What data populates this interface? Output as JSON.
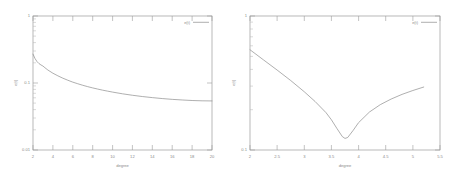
{
  "figure": {
    "background_color": "#ffffff",
    "line_color": "#8d8d8d",
    "axis_color": "#9a9a9a",
    "panel_count": 2
  },
  "chart_data": [
    {
      "type": "line",
      "panel": "left",
      "title": "",
      "xlabel": "degree",
      "ylabel": "e(t)",
      "xscale": "linear",
      "yscale": "log",
      "xlim": [
        2,
        20
      ],
      "ylim": [
        0.01,
        1
      ],
      "grid": false,
      "legend_position": "top-right",
      "xticks": [
        2,
        4,
        6,
        8,
        10,
        12,
        14,
        16,
        18,
        20
      ],
      "xticklabels": [
        "2",
        "4",
        "6",
        "8",
        "10",
        "12",
        "14",
        "16",
        "18",
        "20"
      ],
      "yticks": [
        0.01,
        0.1,
        1
      ],
      "yticklabels": [
        "0.01",
        "0.1",
        "1"
      ],
      "series": [
        {
          "name": "e(t)",
          "x": [
            2,
            2.2,
            2.4,
            2.6,
            2.8,
            3,
            3.2,
            3.5,
            4,
            4.5,
            5,
            5.5,
            6,
            6.5,
            7,
            7.5,
            8,
            8.5,
            9,
            9.5,
            10,
            11,
            12,
            13,
            14,
            15,
            16,
            17,
            18,
            19,
            20
          ],
          "y": [
            0.27,
            0.232,
            0.209,
            0.195,
            0.186,
            0.179,
            0.169,
            0.156,
            0.14,
            0.128,
            0.118,
            0.11,
            0.103,
            0.0975,
            0.0925,
            0.0882,
            0.0845,
            0.0812,
            0.0782,
            0.0756,
            0.0732,
            0.069,
            0.0656,
            0.0628,
            0.0605,
            0.0586,
            0.057,
            0.0558,
            0.0548,
            0.0542,
            0.054
          ]
        }
      ]
    },
    {
      "type": "line",
      "panel": "right",
      "title": "",
      "xlabel": "degree",
      "ylabel": "e(t)",
      "xscale": "linear",
      "yscale": "log",
      "xlim": [
        2,
        5.5
      ],
      "ylim": [
        0.1,
        1
      ],
      "grid": false,
      "legend_position": "top-right",
      "xticks": [
        2,
        2.5,
        3,
        3.5,
        4,
        4.5,
        5,
        5.5
      ],
      "xticklabels": [
        "2",
        "2.5",
        "3",
        "3.5",
        "4",
        "4.5",
        "5",
        "5.5"
      ],
      "yticks": [
        0.1,
        1
      ],
      "yticklabels": [
        "0.1",
        "1"
      ],
      "series": [
        {
          "name": "e(t)",
          "x": [
            2,
            2.25,
            2.5,
            2.75,
            3,
            3.2,
            3.4,
            3.5,
            3.6,
            3.7,
            3.75,
            3.8,
            3.9,
            4,
            4.2,
            4.4,
            4.6,
            4.8,
            5,
            5.2
          ],
          "y": [
            0.56,
            0.47,
            0.395,
            0.33,
            0.272,
            0.23,
            0.19,
            0.168,
            0.145,
            0.126,
            0.122,
            0.124,
            0.14,
            0.16,
            0.192,
            0.218,
            0.24,
            0.26,
            0.278,
            0.295
          ]
        }
      ]
    }
  ]
}
